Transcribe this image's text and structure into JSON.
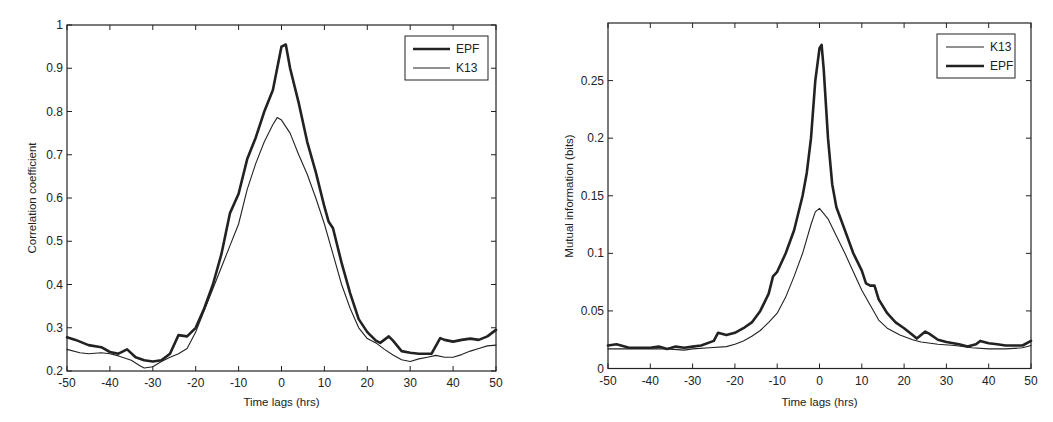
{
  "chart_data": [
    {
      "type": "line",
      "title": "",
      "xlabel": "Time lags (hrs)",
      "ylabel": "Correlation coefficient",
      "xlim": [
        -50,
        50
      ],
      "ylim": [
        0.2,
        1.0
      ],
      "xticks": [
        -50,
        -40,
        -30,
        -20,
        -10,
        0,
        10,
        20,
        30,
        40,
        50
      ],
      "yticks": [
        0.2,
        0.3,
        0.4,
        0.5,
        0.6,
        0.7,
        0.8,
        0.9,
        1
      ],
      "ytick_labels": [
        "0.2",
        "0.3",
        "0.4",
        "0.5",
        "0.6",
        "0.7",
        "0.8",
        "0.9",
        "1"
      ],
      "grid": false,
      "legend": {
        "position": "upper right",
        "entries": [
          "EPF",
          "K13"
        ]
      },
      "series": [
        {
          "name": "EPF",
          "line": "thick",
          "x": [
            -50,
            -48,
            -45,
            -42,
            -40,
            -38,
            -36,
            -34,
            -32,
            -30,
            -28,
            -26,
            -24,
            -22,
            -20,
            -18,
            -16,
            -14,
            -12,
            -10,
            -8,
            -6,
            -4,
            -2,
            -1,
            0,
            1,
            2,
            4,
            6,
            8,
            10,
            11,
            12,
            14,
            16,
            18,
            20,
            22,
            23,
            25,
            26,
            28,
            30,
            32,
            35,
            37,
            38,
            40,
            42,
            44,
            46,
            48,
            50
          ],
          "y": [
            0.278,
            0.272,
            0.26,
            0.255,
            0.244,
            0.24,
            0.25,
            0.232,
            0.225,
            0.222,
            0.225,
            0.24,
            0.283,
            0.28,
            0.3,
            0.345,
            0.4,
            0.47,
            0.565,
            0.61,
            0.69,
            0.74,
            0.8,
            0.85,
            0.9,
            0.95,
            0.955,
            0.9,
            0.82,
            0.73,
            0.66,
            0.58,
            0.545,
            0.53,
            0.45,
            0.38,
            0.32,
            0.29,
            0.27,
            0.265,
            0.28,
            0.27,
            0.246,
            0.242,
            0.24,
            0.24,
            0.276,
            0.272,
            0.268,
            0.272,
            0.275,
            0.272,
            0.28,
            0.295
          ]
        },
        {
          "name": "K13",
          "line": "thin",
          "x": [
            -50,
            -47,
            -45,
            -42,
            -40,
            -38,
            -35,
            -33,
            -32,
            -30,
            -28,
            -26,
            -24,
            -22,
            -20,
            -18,
            -16,
            -14,
            -12,
            -10,
            -8,
            -6,
            -4,
            -2,
            -1,
            0,
            2,
            4,
            6,
            8,
            10,
            12,
            14,
            16,
            18,
            20,
            22,
            24,
            26,
            28,
            30,
            32,
            34,
            36,
            38,
            40,
            42,
            44,
            46,
            48,
            50
          ],
          "y": [
            0.25,
            0.242,
            0.24,
            0.242,
            0.24,
            0.235,
            0.225,
            0.212,
            0.207,
            0.21,
            0.222,
            0.232,
            0.24,
            0.252,
            0.29,
            0.34,
            0.39,
            0.44,
            0.49,
            0.54,
            0.62,
            0.68,
            0.73,
            0.77,
            0.786,
            0.78,
            0.75,
            0.7,
            0.655,
            0.6,
            0.54,
            0.47,
            0.4,
            0.345,
            0.3,
            0.275,
            0.265,
            0.25,
            0.237,
            0.226,
            0.222,
            0.228,
            0.232,
            0.236,
            0.232,
            0.232,
            0.238,
            0.246,
            0.252,
            0.258,
            0.26
          ]
        }
      ]
    },
    {
      "type": "line",
      "title": "",
      "xlabel": "Time lags (hrs)",
      "ylabel": "Mutual information (bits)",
      "xlim": [
        -50,
        50
      ],
      "ylim": [
        0,
        0.3
      ],
      "xticks": [
        -50,
        -40,
        -30,
        -20,
        -10,
        0,
        10,
        20,
        30,
        40,
        50
      ],
      "yticks": [
        0,
        0.05,
        0.1,
        0.15,
        0.2,
        0.25
      ],
      "ytick_labels": [
        "0",
        "0.05",
        "0.1",
        "0.15",
        "0.2",
        "0.25"
      ],
      "grid": false,
      "legend": {
        "position": "upper right",
        "entries": [
          "K13",
          "EPF"
        ]
      },
      "series": [
        {
          "name": "K13",
          "line": "thin",
          "x": [
            -50,
            -45,
            -40,
            -36,
            -32,
            -30,
            -26,
            -22,
            -20,
            -18,
            -16,
            -14,
            -12,
            -10,
            -8,
            -6,
            -4,
            -2,
            -1,
            0,
            2,
            4,
            6,
            8,
            10,
            12,
            14,
            16,
            19,
            22,
            24,
            28,
            32,
            36,
            40,
            44,
            48,
            50
          ],
          "y": [
            0.017,
            0.017,
            0.017,
            0.017,
            0.016,
            0.017,
            0.018,
            0.019,
            0.021,
            0.024,
            0.028,
            0.033,
            0.04,
            0.048,
            0.062,
            0.08,
            0.1,
            0.125,
            0.136,
            0.139,
            0.13,
            0.115,
            0.1,
            0.084,
            0.068,
            0.055,
            0.042,
            0.035,
            0.029,
            0.025,
            0.023,
            0.021,
            0.02,
            0.018,
            0.017,
            0.017,
            0.018,
            0.02
          ]
        },
        {
          "name": "EPF",
          "line": "thick",
          "x": [
            -50,
            -48,
            -45,
            -42,
            -40,
            -38,
            -36,
            -34,
            -32,
            -30,
            -28,
            -25,
            -24,
            -22,
            -20,
            -18,
            -16,
            -14,
            -12,
            -11,
            -10,
            -8,
            -6,
            -4,
            -3,
            -2,
            -1,
            0,
            0.5,
            1,
            2,
            3,
            4,
            6,
            8,
            10,
            11,
            12,
            13,
            14,
            16,
            18,
            20,
            22,
            23,
            25,
            26,
            28,
            30,
            33,
            35,
            37,
            38,
            40,
            42,
            44,
            46,
            48,
            50
          ],
          "y": [
            0.02,
            0.021,
            0.018,
            0.018,
            0.018,
            0.019,
            0.017,
            0.019,
            0.018,
            0.019,
            0.02,
            0.024,
            0.031,
            0.029,
            0.031,
            0.035,
            0.04,
            0.05,
            0.065,
            0.08,
            0.084,
            0.1,
            0.12,
            0.15,
            0.17,
            0.2,
            0.25,
            0.278,
            0.281,
            0.26,
            0.2,
            0.16,
            0.14,
            0.12,
            0.1,
            0.085,
            0.074,
            0.072,
            0.072,
            0.06,
            0.048,
            0.04,
            0.035,
            0.029,
            0.026,
            0.032,
            0.03,
            0.025,
            0.023,
            0.021,
            0.019,
            0.021,
            0.024,
            0.022,
            0.021,
            0.02,
            0.02,
            0.02,
            0.024
          ]
        }
      ]
    }
  ]
}
